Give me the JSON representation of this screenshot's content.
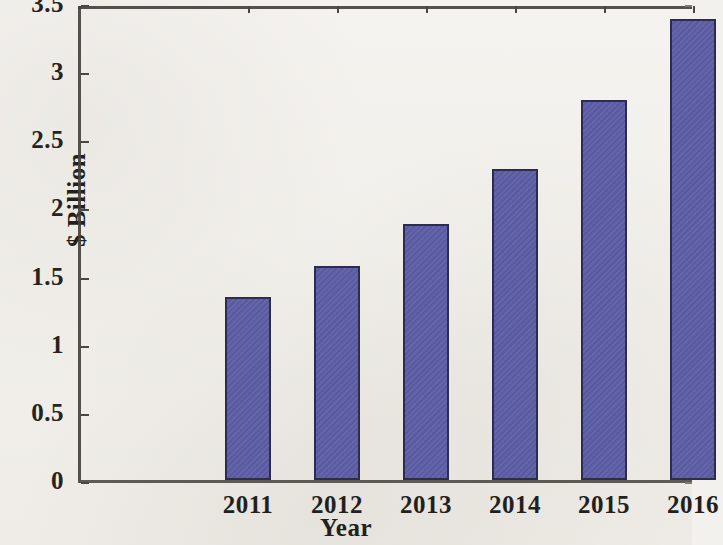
{
  "chart_data": {
    "type": "bar",
    "title": "",
    "subtitle": "",
    "xlabel": "Year",
    "ylabel": "$ Billion",
    "categories": [
      "2011",
      "2012",
      "2013",
      "2014",
      "2015",
      "2016"
    ],
    "values": [
      1.34,
      1.57,
      1.88,
      2.28,
      2.79,
      3.38
    ],
    "series": [
      {
        "name": "",
        "values": [
          1.34,
          1.57,
          1.88,
          2.28,
          2.79,
          3.38
        ]
      }
    ],
    "ylim": [
      0,
      3.5
    ],
    "ytick_labels": [
      "0",
      "0.5",
      "1",
      "1.5",
      "2",
      "2.5",
      "3",
      "3.5"
    ],
    "ytick_values": [
      0,
      0.5,
      1,
      1.5,
      2,
      2.5,
      3,
      3.5
    ],
    "xtick_labels": [
      "2011",
      "2012",
      "2013",
      "2014",
      "2015",
      "2016"
    ],
    "grid": false,
    "legend": "none",
    "bar_color": "#5d5da6",
    "bar_edge_color": "#2c2c4e",
    "background_color": "#f3f1ed",
    "axis_color": "#45423e",
    "text_color": "#231f1c"
  }
}
